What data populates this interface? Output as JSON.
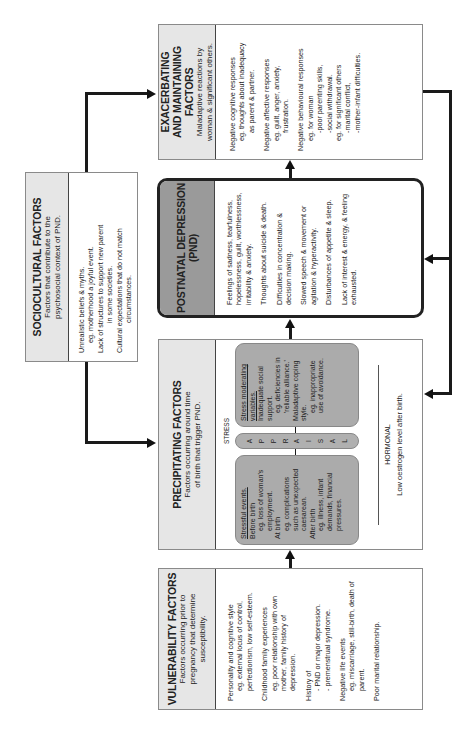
{
  "vulnerability": {
    "title": "VULNERABILITY FACTORS",
    "subtitle": "Factors occurring prior to pregnancy that determine susceptibility.",
    "items": [
      {
        "label": "Personality and cognitive style",
        "detail": "eg. external locus of control, perfectionism, low self-esteem."
      },
      {
        "label": "Childhood family experiences",
        "detail": "eg. poor relationship with own mother, family history of depression."
      },
      {
        "label": "History of",
        "detail": "- PND or major depression.",
        "detail2": "- premenstrual syndrome."
      },
      {
        "label": "Negative life events",
        "detail": "eg. miscarriage, still-birth, death of parent."
      },
      {
        "label": "Poor marital relationship."
      }
    ]
  },
  "precipitating": {
    "title": "PRECIPITATING FACTORS",
    "subtitle": "Factors occurring around time of birth that trigger PND.",
    "stress_label": "STRESS",
    "stressful_events": {
      "heading": "Stressful events.",
      "lines": [
        "Before birth",
        "eg. loss of woman's employment.",
        "At birth",
        "eg. complications such as unexpected caesarean.",
        "After birth",
        "eg. illness, infant demands, financial pressures."
      ]
    },
    "appraisal": [
      "A",
      "P",
      "P",
      "R",
      "A",
      "I",
      "S",
      "A",
      "L"
    ],
    "moderating": {
      "heading": "Stress moderating variables.",
      "lines": [
        "Inadequate social support.",
        "eg. deficiencies in 'reliable alliance.'",
        "Maladaptive coping style.",
        "eg. inappropriate use of avoidance."
      ]
    },
    "hormonal_label": "HORMONAL",
    "hormonal_text": "Low oestrogen level after birth."
  },
  "pnd": {
    "title": "POSTNATAL DEPRESSION",
    "abbr": "(PND)",
    "items": [
      "Feelings of sadness, tearfulness, hopelessness, guilt, worthlessness, irritability & anxiety.",
      "Thoughts about suicide & death.",
      "Difficulties in concentration & decision making.",
      "Slowed speech & movement or agitation & hyperactivity.",
      "Disturbances of appetite & sleep.",
      "Lack of interest & energy, & feeling exhausted."
    ]
  },
  "exacerbating": {
    "title": "EXACERBATING AND MAINTAINING FACTORS",
    "subtitle": "Maladaptive reactions by woman & significant others.",
    "items": [
      {
        "label": "Negative cognitive responses",
        "lines": [
          "eg. thoughts about inadequacy",
          "as parent & partner."
        ]
      },
      {
        "label": "Negative affective responses",
        "lines": [
          "eg. guilt, anger, anxiety,",
          "frustration."
        ]
      },
      {
        "label": "Negative behavioural responses",
        "lines": [
          "eg. for woman",
          "-poor parenting skills,",
          "-social withdrawal.",
          "eg. for significant others",
          "-marital conflict,",
          "-mother-infant difficulties."
        ]
      }
    ]
  },
  "sociocultural": {
    "title": "SOCIOCULTURAL FACTORS",
    "subtitle": "Factors that contribute to the psychosocial context of PND.",
    "lines": [
      "Unrealistic beliefs & myths.",
      "eg. motherhood a joyful event.",
      "Lack of structures to support new parent",
      "in some societies.",
      "Cultural expectations that do not match",
      "circumstances."
    ]
  }
}
